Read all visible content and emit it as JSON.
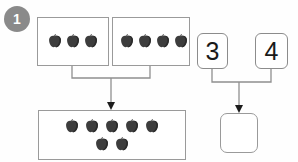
{
  "problem": {
    "number": "1",
    "badge_color": "#8a8a8a"
  },
  "equation": {
    "addend_1": "3",
    "addend_2": "4",
    "sum": "",
    "sum_placeholder": ""
  },
  "groups": {
    "left_box": {
      "label": "group-box-addend-1",
      "apple_count": 3,
      "rows": [
        3
      ]
    },
    "right_box": {
      "label": "group-box-addend-2",
      "apple_count": 4,
      "rows": [
        4
      ]
    },
    "total_box": {
      "label": "group-box-total",
      "apple_count": 7,
      "rows": [
        5,
        2
      ]
    }
  },
  "cards": {
    "card_1_value": "3",
    "card_2_value": "4",
    "answer_value": ""
  },
  "colors": {
    "apple_body": "#3d3d3d",
    "apple_shade": "#2b2b2b",
    "apple_stem": "#1f1f1f",
    "box_border": "#9a9a9a",
    "card_border": "#8c8c8c",
    "wire": "#8f8f8f",
    "badge": "#8a8a8a",
    "text": "#1a1a1a"
  },
  "icons": {
    "apple": "apple-icon",
    "arrow_down": "arrow-down-icon",
    "badge": "problem-number-badge"
  }
}
